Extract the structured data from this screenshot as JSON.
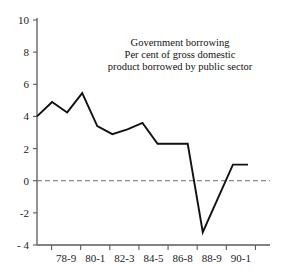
{
  "chart_data": {
    "type": "line",
    "title": "Government borrowing",
    "subtitle_line1": "Per cent of gross domestic",
    "subtitle_line2": "product borrowed by public sector",
    "xlabel": "",
    "ylabel": "",
    "grid": false,
    "legend": "none",
    "zero_reference_line": true,
    "ylim": [
      -4,
      10
    ],
    "yticks": [
      10,
      8,
      6,
      4,
      2,
      0,
      -2,
      -4
    ],
    "ytick_labels": [
      "10",
      "8",
      "6",
      "4",
      "2",
      "0",
      "-2",
      "- 4"
    ],
    "xtick_labels": [
      "78-9",
      "80-1",
      "82-3",
      "84-5",
      "86-8",
      "88-9",
      "90-1"
    ],
    "series": [
      {
        "name": "Public sector borrowing as % of GDP",
        "x": [
          0,
          1,
          2,
          3,
          4,
          5,
          6,
          7,
          8,
          9,
          10,
          11,
          12,
          13,
          14
        ],
        "values": [
          4.0,
          4.9,
          4.25,
          5.45,
          3.4,
          2.9,
          3.2,
          3.6,
          2.3,
          2.3,
          2.3,
          -3.2,
          -1.1,
          1.0,
          1.0
        ]
      }
    ],
    "line_color": "#111111",
    "axis_color": "#5a5a5a",
    "zero_line_color": "#6d6d6d"
  },
  "figure": {
    "background": "#ffffff"
  }
}
